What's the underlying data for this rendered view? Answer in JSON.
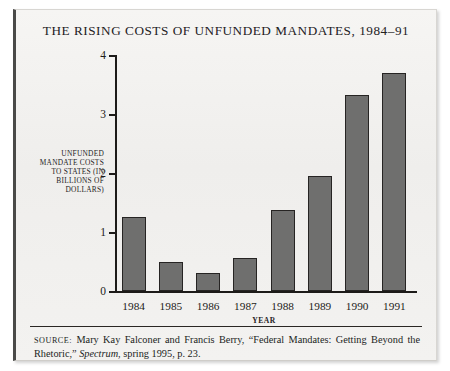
{
  "figure": {
    "title": "THE RISING COSTS OF UNFUNDED MANDATES, 1984–91",
    "source_prefix": "SOURCE:",
    "source_text_1": " Mary Kay Falconer and Francis Berry, “Federal Mandates: Getting Beyond the Rhetoric,” ",
    "source_italic": "Spectrum",
    "source_text_2": ", spring 1995, p. 23."
  },
  "chart_data": {
    "type": "bar",
    "title": "THE RISING COSTS OF UNFUNDED MANDATES, 1984–91",
    "xlabel": "YEAR",
    "ylabel": "UNFUNDED MANDATE COSTS TO STATES (IN BILLIONS OF DOLLARS)",
    "categories": [
      "1984",
      "1985",
      "1986",
      "1987",
      "1988",
      "1989",
      "1990",
      "1991"
    ],
    "values": [
      1.25,
      0.49,
      0.3,
      0.56,
      1.37,
      1.95,
      3.32,
      3.69
    ],
    "ylim": [
      0,
      4
    ],
    "yticks": [
      0,
      1,
      2,
      3,
      4
    ],
    "ytick_labels": [
      "0",
      "1",
      "2",
      "3",
      "4"
    ],
    "grid": false,
    "legend": false,
    "bar_color": "#6f6f6e",
    "bar_edge_color": "#262423",
    "axis_color": "#1d1b19"
  }
}
